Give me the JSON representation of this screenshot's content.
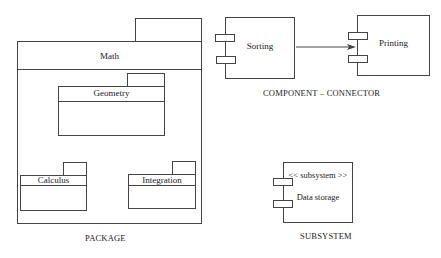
{
  "package": {
    "caption": "PACKAGE",
    "root": {
      "name": "Math"
    },
    "children": [
      {
        "name": "Geometry"
      },
      {
        "name": "Calculus"
      },
      {
        "name": "Integration"
      }
    ]
  },
  "component_connector": {
    "caption": "COMPONENT  – CONNECTOR",
    "source": {
      "name": "Sorting"
    },
    "target": {
      "name": "Printing"
    }
  },
  "subsystem": {
    "caption": "SUBSYSTEM",
    "stereotype": "<< subsystem >>",
    "name": "Data storage"
  },
  "colors": {
    "stroke": "#444444",
    "background": "#ffffff",
    "text": "#222222"
  }
}
